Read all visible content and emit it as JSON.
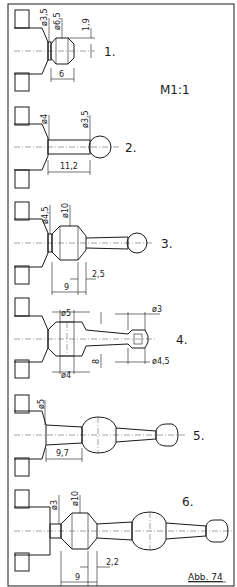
{
  "figure": {
    "scale": "M1:1",
    "caption": "Abb. 74"
  },
  "parts": [
    {
      "label": "1.",
      "dims": [
        "ø3,5",
        "ø6,5",
        "1,9",
        "6"
      ]
    },
    {
      "label": "2.",
      "dims": [
        "ø4",
        "ø3,5",
        "11,2"
      ]
    },
    {
      "label": "3.",
      "dims": [
        "ø4,5",
        "ø10",
        "2,5",
        "9"
      ]
    },
    {
      "label": "4.",
      "dims": [
        "ø5",
        "ø3",
        "8",
        "ø4",
        "ø4,5"
      ]
    },
    {
      "label": "5.",
      "dims": [
        "ø5",
        "9,7"
      ]
    },
    {
      "label": "6.",
      "dims": [
        "ø3",
        "ø10",
        "2,2",
        "9"
      ]
    }
  ]
}
